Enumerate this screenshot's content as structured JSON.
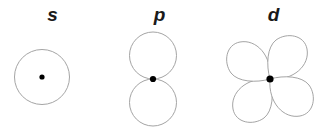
{
  "figure": {
    "name": "atomic-orbital-shapes",
    "background_color": "#ffffff",
    "outline_color": "#9a9a9a",
    "nucleus_color": "#000000",
    "label_color": "#1a1a1a"
  },
  "orbitals": [
    {
      "id": "s",
      "label": "s",
      "lobe_count": 1,
      "shape": "sphere",
      "nucleus": {
        "x": 42,
        "y": 77
      },
      "description": "single circle with central nucleus dot"
    },
    {
      "id": "p",
      "label": "p",
      "lobe_count": 2,
      "shape": "dumbbell",
      "nucleus": {
        "x": 153,
        "y": 79
      },
      "description": "two circular lobes stacked vertically meeting at the nucleus"
    },
    {
      "id": "d",
      "label": "d",
      "lobe_count": 4,
      "shape": "cloverleaf",
      "nucleus": {
        "x": 270,
        "y": 79
      },
      "description": "four teardrop lobes arranged diagonally meeting at the nucleus"
    }
  ]
}
